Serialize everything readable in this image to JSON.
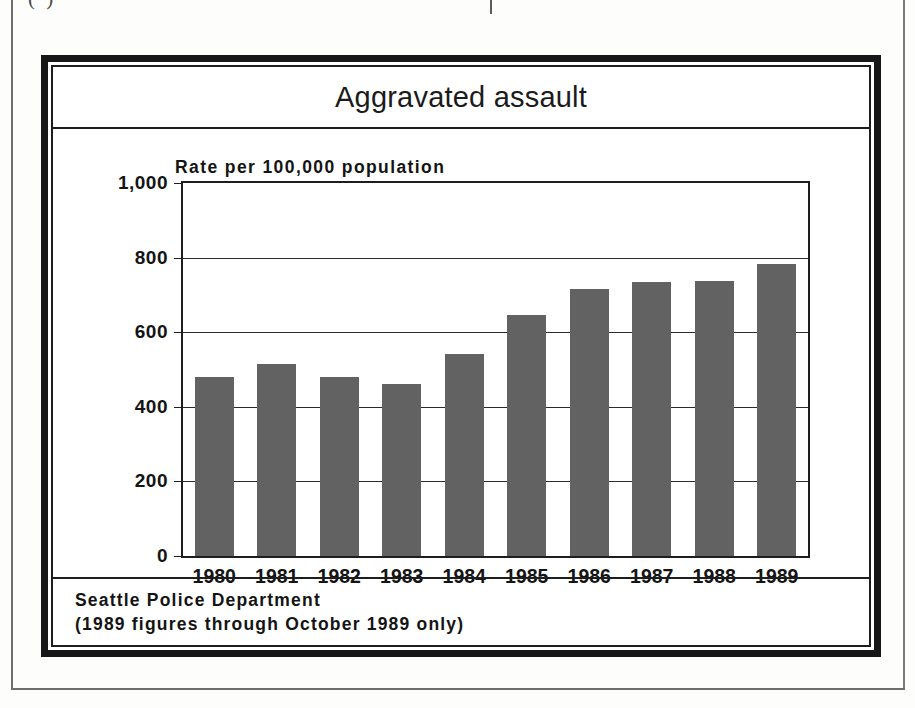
{
  "page": {
    "crop_caption": "( )",
    "background_color": "#fdfdfb",
    "frame_color": "#171717"
  },
  "chart": {
    "title": "Aggravated assault",
    "axis_caption": "Rate per 100,000 population",
    "bar_color": "#626262",
    "source_line_1": "Seattle Police Department",
    "source_line_2": "(1989 figures through October 1989 only)"
  },
  "chart_data": {
    "type": "bar",
    "title": "Aggravated assault",
    "subtitle": "",
    "xlabel": "",
    "ylabel": "Rate per 100,000 population",
    "categories": [
      "1980",
      "1981",
      "1982",
      "1983",
      "1984",
      "1985",
      "1986",
      "1987",
      "1988",
      "1989"
    ],
    "values": [
      480,
      515,
      480,
      462,
      542,
      645,
      715,
      735,
      737,
      782
    ],
    "ylim": [
      0,
      1000
    ],
    "yticks": [
      0,
      200,
      400,
      600,
      800,
      1000
    ],
    "ytick_labels": [
      "0",
      "200",
      "400",
      "600",
      "800",
      "1,000"
    ],
    "grid": true,
    "grid_axis": "y",
    "legend": false,
    "legend_position": "none",
    "series": [
      {
        "name": "Aggravated assault rate",
        "values": [
          480,
          515,
          480,
          462,
          542,
          645,
          715,
          735,
          737,
          782
        ]
      }
    ],
    "annotations": [
      "Seattle Police Department",
      "(1989 figures through October 1989 only)"
    ]
  }
}
